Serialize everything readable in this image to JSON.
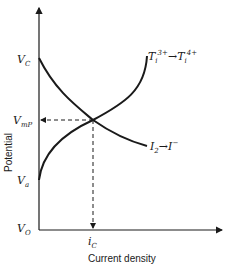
{
  "diagram": {
    "axes": {
      "x_label": "Current density",
      "y_label": "Potential"
    },
    "y_ticks": {
      "vc": "V",
      "vc_sub": "C",
      "vmp": "V",
      "vmp_sub": "mP",
      "va": "V",
      "va_sub": "a",
      "vo": "V",
      "vo_sub": "O"
    },
    "x_ticks": {
      "ic": "i",
      "ic_sub": "C"
    },
    "curves": {
      "anodic": {
        "label_a": "T",
        "label_a_sub": "i",
        "label_a_sup": "3+",
        "arrow": "→",
        "label_b": "T",
        "label_b_sub": "i",
        "label_b_sup": "4+"
      },
      "cathodic": {
        "label_a": "I",
        "label_a_sub": "2",
        "arrow": "→",
        "label_b": "I",
        "label_b_sup": "−"
      }
    }
  }
}
